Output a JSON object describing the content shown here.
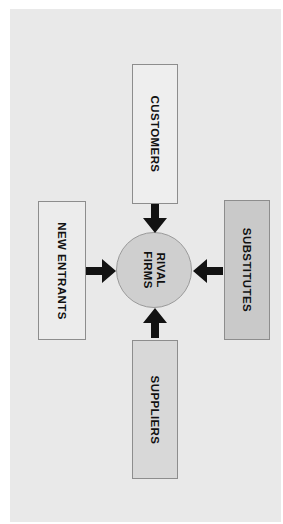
{
  "diagram": {
    "orientation": "rotated-90-clockwise",
    "page_background": "#ffffff",
    "canvas_background": "#e9e9e9",
    "center": {
      "label_line1": "RIVAL",
      "label_line2": "FIRMS",
      "shape": "circle",
      "fill": "#cfcfcf",
      "stroke": "#9a9a9a"
    },
    "forces": [
      {
        "id": "customers",
        "label": "CUSTOMERS",
        "fill": "#eeeeee",
        "stroke": "#8d8d8d",
        "arrow": {
          "name": "arrow-down-icon",
          "direction": "down",
          "color": "#121212"
        }
      },
      {
        "id": "new-entrants",
        "label": "NEW ENTRANTS",
        "fill": "#ececec",
        "stroke": "#8d8d8d",
        "arrow": {
          "name": "arrow-right-icon",
          "direction": "right",
          "color": "#121212"
        }
      },
      {
        "id": "substitutes",
        "label": "SUBSTITUTES",
        "fill": "#c9c9c9",
        "stroke": "#8d8d8d",
        "arrow": {
          "name": "arrow-left-icon",
          "direction": "left",
          "color": "#121212"
        }
      },
      {
        "id": "suppliers",
        "label": "SUPPLIERS",
        "fill": "#d8d8d8",
        "stroke": "#8d8d8d",
        "arrow": {
          "name": "arrow-up-icon",
          "direction": "up",
          "color": "#121212"
        }
      }
    ]
  }
}
